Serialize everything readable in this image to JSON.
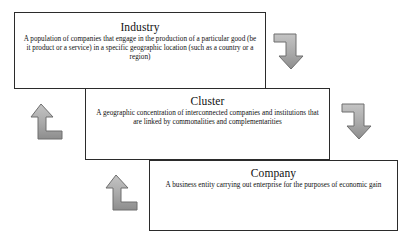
{
  "diagram": {
    "title_hidden": "",
    "boxes": [
      {
        "id": "industry",
        "title": "Industry",
        "description": "A population of companies that engage in the production of a particular good (be it product or a service) in a specific geographic location (such as a country or a region)"
      },
      {
        "id": "cluster",
        "title": "Cluster",
        "description": "A geographic concentration of interconnected companies and institutions that are linked by commonalities and complementarities"
      },
      {
        "id": "company",
        "title": "Company",
        "description": "A business entity carrying out enterprise for the purposes of economic gain"
      }
    ],
    "arrows": [
      {
        "id": "industry-to-cluster",
        "icon": "bent-arrow-down-icon",
        "direction": "down"
      },
      {
        "id": "cluster-to-industry",
        "icon": "bent-arrow-up-icon",
        "direction": "up"
      },
      {
        "id": "cluster-to-company",
        "icon": "bent-arrow-down-icon",
        "direction": "down"
      },
      {
        "id": "company-to-cluster",
        "icon": "bent-arrow-up-icon",
        "direction": "up"
      }
    ],
    "colors": {
      "background": "#ffffff",
      "box_border": "#2b2b2b",
      "text": "#111111",
      "arrow_fill": "#a9a9a9",
      "arrow_fill_light": "#c4c4c4",
      "arrow_fill_dark": "#8d8d8d",
      "arrow_stroke": "#6e6e6e"
    }
  }
}
